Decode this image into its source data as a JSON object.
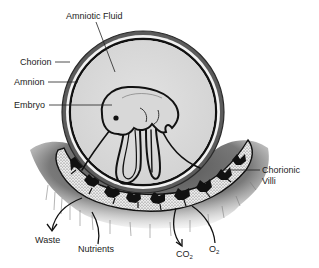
{
  "diagram": {
    "labels": {
      "amniotic_fluid": "Amniotic Fluid",
      "chorion": "Chorion",
      "amnion": "Amnion",
      "embryo": "Embryo",
      "chorionic_villi_line1": "Chorionic",
      "chorionic_villi_line2": "Villi",
      "waste": "Waste",
      "nutrients": "Nutrients",
      "co2_base": "CO",
      "co2_sub": "2",
      "o2_base": "O",
      "o2_sub": "2"
    },
    "colors": {
      "ink": "#111111",
      "fluid": "#dcdcdc",
      "chorion_band": "#555555",
      "tissue": "#6e6e6e",
      "villi_fill": "#e8e8e8",
      "background": "#ffffff"
    }
  }
}
